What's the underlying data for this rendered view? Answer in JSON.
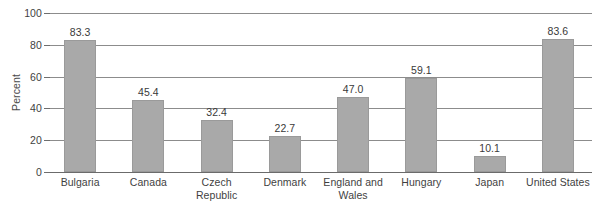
{
  "chart_data": {
    "type": "bar",
    "title": "",
    "xlabel": "",
    "ylabel": "Percent",
    "ylim": [
      0,
      100
    ],
    "yticks": [
      0,
      20,
      40,
      60,
      80,
      100
    ],
    "grid": "horizontal",
    "legend": "none",
    "categories": [
      "Bulgaria",
      "Canada",
      "Czech Republic",
      "Denmark",
      "England and Wales",
      "Hungary",
      "Japan",
      "United States"
    ],
    "values": [
      83.3,
      45.4,
      32.4,
      22.7,
      47.0,
      59.1,
      10.1,
      83.6
    ],
    "value_labels": [
      "83.3",
      "45.4",
      "32.4",
      "22.7",
      "47.0",
      "59.1",
      "10.1",
      "83.6"
    ],
    "ytick_labels": [
      "0",
      "20",
      "40",
      "60",
      "80",
      "100"
    ],
    "bar_color": "#a9a9a9",
    "bar_edge_color": "#9a9a9a",
    "gridline_color": "#8c8c8c",
    "axis_color": "#6b6b6b",
    "text_color": "#3f3f3f",
    "background_color": "#ffffff"
  }
}
